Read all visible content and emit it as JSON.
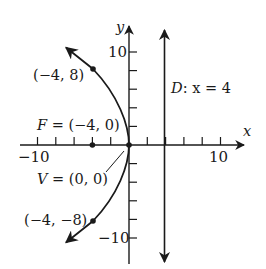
{
  "figure": {
    "type": "parabola-diagram",
    "equation_hint": "y^2 = -16x",
    "colors": {
      "ink": "#1a1a1a",
      "background": "#ffffff"
    },
    "axes": {
      "x_label": "x",
      "y_label": "y",
      "x_tick_labels": {
        "neg": "−10",
        "pos": "10"
      },
      "y_tick_labels": {
        "pos": "10",
        "neg": "−10"
      },
      "tick_step": 2,
      "range": [
        -10,
        10
      ]
    },
    "labels": {
      "point_upper": "(−4, 8)",
      "focus": "F = (−4, 0)",
      "vertex": "V = (0, 0)",
      "point_lower": "(−4, −8)",
      "directrix_name": "D",
      "directrix_eq": ": x = 4"
    },
    "points": [
      {
        "name": "upper",
        "x": -4,
        "y": 8
      },
      {
        "name": "focus",
        "x": -4,
        "y": 0
      },
      {
        "name": "vertex",
        "x": 0,
        "y": 0
      },
      {
        "name": "lower",
        "x": -4,
        "y": -8
      }
    ],
    "directrix": {
      "x": 4
    }
  }
}
